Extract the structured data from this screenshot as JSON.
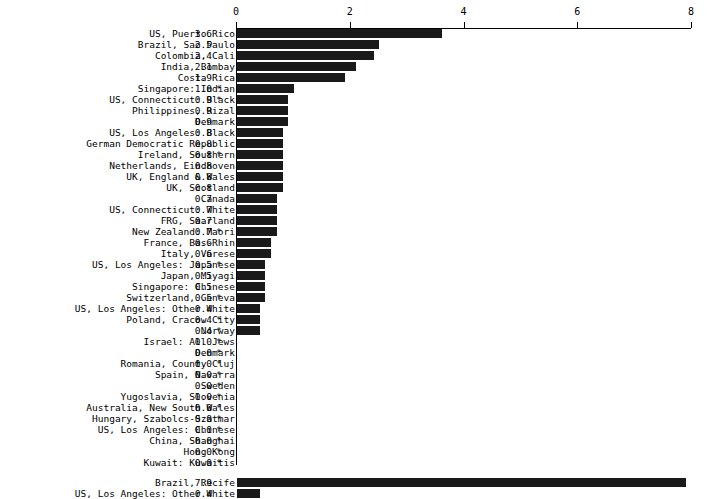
{
  "chart_data": {
    "type": "bar",
    "orientation": "horizontal",
    "title": "",
    "xlabel": "",
    "ylabel": "",
    "xlim": [
      0,
      8
    ],
    "xticks": [
      0,
      2,
      4,
      6,
      8
    ],
    "xtick_labels": [
      "0",
      "2",
      "4",
      "6",
      "8"
    ],
    "grid": false,
    "legend": null,
    "axis_position": "top",
    "note": "Values marked with * are flagged",
    "groups": [
      {
        "name": "main",
        "categories": [
          "US, Puerto Rico",
          "Brazil, Sao Paulo",
          "Colombia, Cali",
          "India, Bombay",
          "Costa Rica",
          "Singapore: Indian",
          "US, Connecticut: Black",
          "Philippines, Rizal",
          "Denmark",
          "US, Los Angeles: Black",
          "German Democratic Republic",
          "Ireland, Southern",
          "Netherlands, Eindhoven",
          "UK, England & Wales",
          "UK, Scotland",
          "Canada",
          "US, Connecticut: White",
          "FRG, Saarland",
          "New Zealand: Maori",
          "France, Bas-Rhin",
          "Italy, Varese",
          "US, Los Angeles: Japanese",
          "Japan, Miyagi",
          "Singapore: Chinese",
          "Switzerland, Geneva",
          "US, Los Angeles: Other White",
          "Poland, Cracow City",
          "Norway",
          "Israel: All Jews",
          "Denmark",
          "Romania, County Cluj",
          "Spain, Navarra",
          "Sweden",
          "Yugoslavia, Slovenia",
          "Australia, New South Wales",
          "Hungary, Szabolcs-Szatmar",
          "US, Los Angeles: Chinese",
          "China, Shanghai",
          "Hong Kong",
          "Kuwait: Kuwaitis"
        ],
        "values": [
          3.6,
          2.5,
          2.4,
          2.1,
          1.9,
          1.0,
          0.9,
          0.9,
          0.9,
          0.8,
          0.8,
          0.8,
          0.8,
          0.8,
          0.8,
          0.7,
          0.7,
          0.7,
          0.7,
          0.6,
          0.6,
          0.5,
          0.5,
          0.5,
          0.5,
          0.4,
          0.4,
          0.4,
          0.0,
          0.0,
          0.0,
          0.0,
          0.0,
          0.0,
          0.0,
          0.0,
          0.0,
          0.0,
          0.0,
          0.0
        ],
        "value_labels": [
          "3.6",
          "2.5",
          "2.4",
          "2.1",
          "1.9",
          "1.0",
          "0.9",
          "0.9",
          "0.9",
          "0.8",
          "0.8",
          "0.8",
          "0.8",
          "0.8",
          "0.8",
          "0.7",
          "0.7",
          "0.7",
          "0.7",
          "0.6",
          "0.6",
          "0.5",
          "0.5",
          "0.5",
          "0.5",
          "0.4",
          "0.4",
          "0.4",
          "0.0",
          "0.0",
          "0.0",
          "0.0",
          "0.0",
          "0.0",
          "0.0",
          "0.0",
          "0.0",
          "0.0",
          "0.0",
          "0.0"
        ],
        "flags": [
          "",
          "",
          "",
          "",
          "",
          "*",
          "*",
          "",
          "",
          "",
          "",
          "*",
          "",
          "",
          "",
          "",
          "",
          "",
          "*",
          "",
          "",
          "*",
          "",
          "",
          "*",
          "",
          "*",
          "*",
          "*",
          "*",
          "*",
          "*",
          "*",
          "*",
          "*",
          "*",
          "*",
          "*",
          "*",
          "*"
        ]
      },
      {
        "name": "appended",
        "categories": [
          "Brazil, Recife",
          "US, Los Angeles: Other White"
        ],
        "values": [
          7.9,
          0.4
        ],
        "value_labels": [
          "7.9",
          "0.4"
        ],
        "flags": [
          "",
          ""
        ]
      }
    ]
  }
}
